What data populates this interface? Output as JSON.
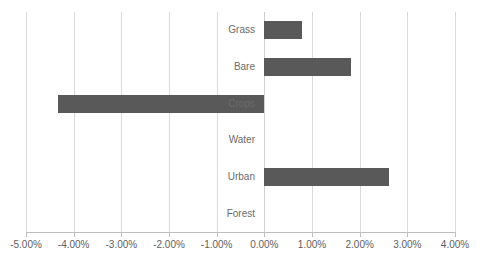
{
  "chart_data": {
    "type": "bar",
    "orientation": "horizontal",
    "title": "",
    "xlabel": "",
    "ylabel": "",
    "categories": [
      "Grass",
      "Bare",
      "Crops",
      "Water",
      "Urban",
      "Forest"
    ],
    "values": [
      0.78,
      1.81,
      -4.33,
      0.0,
      2.61,
      0.0
    ],
    "value_format": "percent",
    "xlim": [
      -5.0,
      4.0
    ],
    "xticks": [
      -5.0,
      -4.0,
      -3.0,
      -2.0,
      -1.0,
      0.0,
      1.0,
      2.0,
      3.0,
      4.0
    ],
    "xtick_labels": [
      "-5.00%",
      "-4.00%",
      "-3.00%",
      "-2.00%",
      "-1.00%",
      "0.00%",
      "1.00%",
      "2.00%",
      "3.00%",
      "4.00%"
    ],
    "grid": "vertical",
    "legend": null,
    "series": [
      {
        "name": "",
        "values": [
          0.78,
          1.81,
          -4.33,
          0.0,
          2.61,
          0.0
        ]
      }
    ]
  },
  "style": {
    "bar_color": "#595959",
    "grid_color": "#d9d9d9",
    "axis_color": "#bfbfbf",
    "label_color": "#6b6b6b",
    "tick_label_color": "#5e5e5e",
    "background": "#ffffff"
  }
}
